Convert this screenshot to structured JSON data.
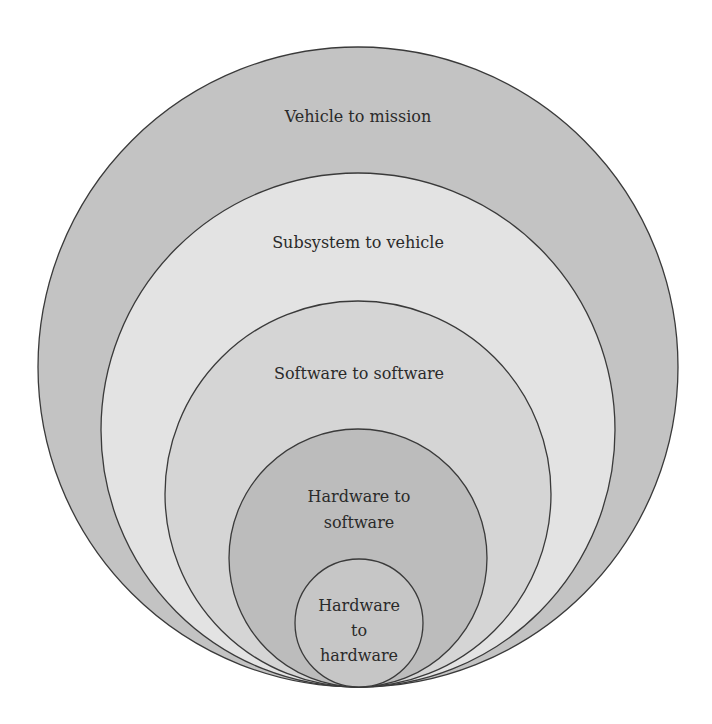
{
  "diagram": {
    "type": "nested-circles",
    "levels": [
      {
        "label_lines": [
          "Vehicle to mission"
        ],
        "fill": "#c3c3c3"
      },
      {
        "label_lines": [
          "Subsystem to vehicle"
        ],
        "fill": "#e3e3e3"
      },
      {
        "label_lines": [
          "Software to software"
        ],
        "fill": "#d5d5d5"
      },
      {
        "label_lines": [
          "Hardware to",
          "software"
        ],
        "fill": "#bcbcbc"
      },
      {
        "label_lines": [
          "Hardware",
          "to",
          "hardware"
        ],
        "fill": "#c6c6c6"
      }
    ],
    "stroke": "#3a3a3a"
  }
}
